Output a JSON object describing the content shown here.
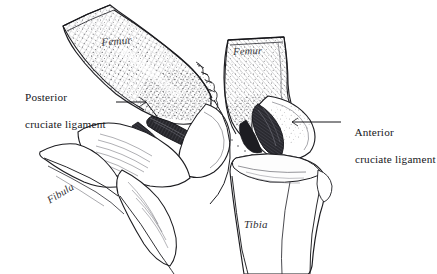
{
  "figure": {
    "medium": "pen-and-ink anatomical engraving",
    "background_color": "#ffffff",
    "ink_color": "#1a1a1e",
    "views": [
      {
        "name": "left-view",
        "description": "flexed knee, lateral/posterior aspect with femur angled down-right"
      },
      {
        "name": "right-view",
        "description": "extended knee, anterior aspect with vertical femur over tibia"
      }
    ]
  },
  "labels": {
    "posterior_ligament": {
      "line1": "Posterior",
      "line2": "cruciate ligament"
    },
    "anterior_ligament": {
      "line1": "Anterior",
      "line2": "cruciate ligament"
    },
    "femur_left": "Femur",
    "femur_right": "Femur",
    "fibula": "Fibula",
    "tibia": "Tibia"
  },
  "leader_lines": [
    {
      "name": "posterior-leader",
      "from": "posterior cruciate ligament label",
      "to": "ligament band in left knee joint space"
    },
    {
      "name": "anterior-leader",
      "from": "femoral condyle notch of right knee",
      "to": "anterior cruciate ligament label"
    }
  ],
  "colors": {
    "ink": "#1a1a1e",
    "hatch": "#5a5a60",
    "stipple": "#4a4a50",
    "ligament_dark": "#232327",
    "bone_fill": "#ffffff",
    "cartilage_tint": "#f2f2f0"
  }
}
